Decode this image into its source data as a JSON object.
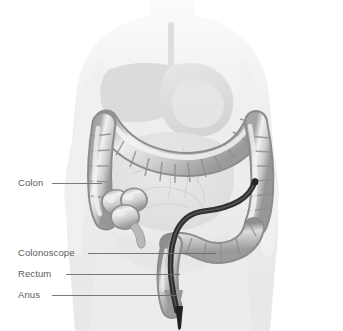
{
  "figure": {
    "background_color": "#ffffff",
    "leader_line_color": "#6b6b6b",
    "label_text_color": "#5c5c5c",
    "body_silhouette_color": "#eaeaea",
    "organ_fill_color": "#d8d8d8",
    "organ_shade_color": "#b4b4b4",
    "organ_highlight_color": "#f0f0f0",
    "scope_color": "#3a3a3a",
    "caption": ""
  },
  "labels": [
    {
      "id": "colon",
      "text": "Colon"
    },
    {
      "id": "colonoscope",
      "text": "Colonoscope"
    },
    {
      "id": "rectum",
      "text": "Rectum"
    },
    {
      "id": "anus",
      "text": "Anus"
    }
  ]
}
